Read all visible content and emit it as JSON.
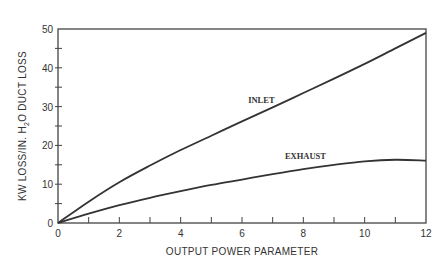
{
  "chart_data": {
    "type": "line",
    "title": "",
    "xlabel": "OUTPUT POWER PARAMETER",
    "ylabel": "KW LOSS/IN. H2O DUCT LOSS",
    "ylabel_parts": {
      "pre": "KW LOSS/IN. H",
      "sub": "2",
      "post": "O DUCT LOSS"
    },
    "xlim": [
      0,
      12
    ],
    "ylim": [
      0,
      50
    ],
    "x_ticks": [
      0,
      2,
      4,
      6,
      8,
      10,
      12
    ],
    "x_minor_ticks": [
      1,
      3,
      5,
      7,
      9,
      11
    ],
    "y_ticks": [
      0,
      10,
      20,
      30,
      40,
      50
    ],
    "y_minor_ticks": [
      5,
      15,
      25,
      35,
      45
    ],
    "grid": false,
    "legend": "inline labels",
    "series": [
      {
        "name": "INLET",
        "x": [
          0,
          1,
          2,
          3,
          4,
          5,
          6,
          7,
          8,
          9,
          10,
          11,
          12
        ],
        "values": [
          0,
          5.5,
          10.5,
          14.8,
          18.8,
          22.5,
          26.2,
          29.8,
          33.5,
          37.2,
          41,
          45,
          49
        ]
      },
      {
        "name": "EXHAUST",
        "x": [
          0,
          1,
          2,
          3,
          4,
          5,
          6,
          7,
          8,
          9,
          10,
          11,
          12
        ],
        "values": [
          0,
          2.4,
          4.6,
          6.5,
          8.2,
          9.8,
          11.2,
          12.6,
          13.9,
          15,
          15.9,
          16.3,
          16.1
        ]
      }
    ],
    "annotations": [
      {
        "text": "INLET",
        "x": 6.2,
        "y": 31
      },
      {
        "text": "EXHAUST",
        "x": 7.4,
        "y": 16.5
      }
    ]
  },
  "axis": {
    "x_title": "OUTPUT POWER PARAMETER",
    "y_title_pre": "KW LOSS/IN. H",
    "y_title_sub": "2",
    "y_title_post": "O DUCT LOSS"
  },
  "labels": {
    "inlet": "INLET",
    "exhaust": "EXHAUST"
  },
  "colors": {
    "line": "#333333",
    "frame": "#444444",
    "text": "#333333"
  }
}
